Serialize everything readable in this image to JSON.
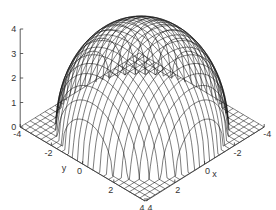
{
  "chart_data": {
    "type": "surface3d",
    "title": "",
    "function": "z = sqrt(max(0, 16 - x^2 - y^2))",
    "x": {
      "label": "x",
      "range": [
        -4,
        4
      ],
      "ticks": [
        -4,
        -2,
        0,
        2,
        4
      ],
      "tick_labels": [
        "-4",
        "-2",
        "0",
        "2",
        "4"
      ]
    },
    "y": {
      "label": "y",
      "range": [
        -4,
        4
      ],
      "ticks": [
        -4,
        -2,
        0,
        2,
        4
      ],
      "tick_labels": [
        "-4",
        "-2",
        "0",
        "2",
        "4"
      ]
    },
    "z": {
      "label": "",
      "range": [
        0,
        4
      ],
      "ticks": [
        0,
        1,
        2,
        3,
        4
      ],
      "tick_labels": [
        "0",
        "1",
        "2",
        "3",
        "4"
      ]
    },
    "grid_lines": 25,
    "grid": false,
    "legend": null,
    "colors": {
      "mesh": "#111111",
      "axes": "#333333",
      "background": "#ffffff"
    }
  }
}
